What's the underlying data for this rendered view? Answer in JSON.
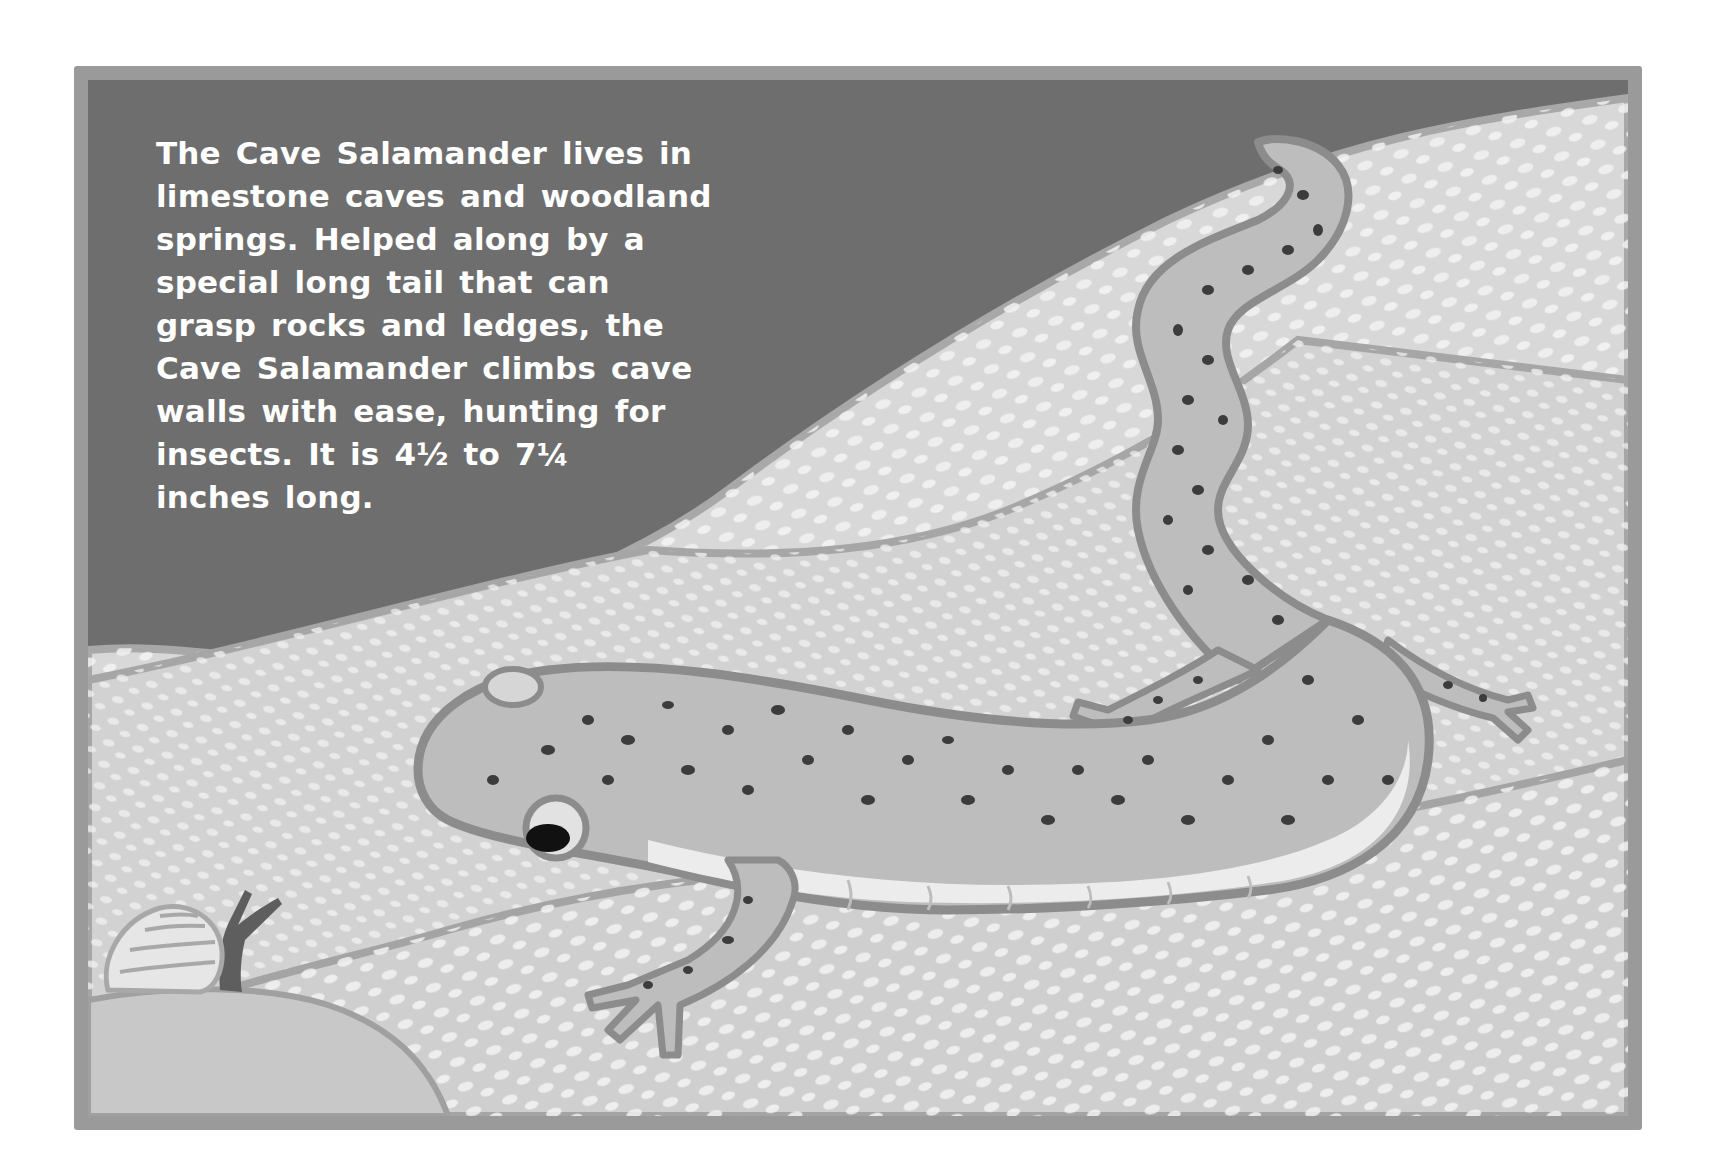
{
  "illustration": {
    "subject": "Cave Salamander",
    "scene": "Spotted salamander crawling across pale speckled limestone rock with a dark cave wall behind; a small snail sits at lower left",
    "elements": [
      "cave-wall",
      "limestone-rock",
      "salamander",
      "snail",
      "painted-frame"
    ],
    "colors": {
      "frame": "#9a9a9a",
      "cave_wall": "#6e6e6e",
      "rock_light": "#dcdcdc",
      "rock_mid": "#c4c4c4",
      "rock_outline": "#a8a8a8",
      "salamander_body": "#bdbdbd",
      "salamander_outline": "#8c8c8c",
      "salamander_belly": "#ececec",
      "spots": "#3c3c3c",
      "eye": "#111111",
      "snail_body": "#5e5e5e",
      "snail_shell": "#e6e6e6",
      "text": "#ffffff"
    }
  },
  "caption": {
    "lines": [
      "The Cave Salamander lives in",
      "limestone caves and woodland",
      "springs. Helped along by a",
      "special long tail that can",
      "grasp rocks and ledges, the",
      "Cave Salamander climbs cave",
      "walls with ease, hunting for",
      "insects. It is 4½ to 7¼",
      "inches long."
    ],
    "length_min": "4½",
    "length_max": "7¼",
    "length_unit": "inches"
  }
}
